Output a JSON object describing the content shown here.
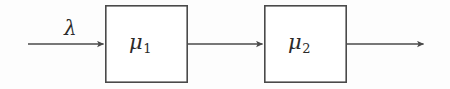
{
  "figure": {
    "type": "block-flow-diagram",
    "canvas": {
      "width": 450,
      "height": 89,
      "background": "#fdfdfd"
    },
    "stroke_color": "#4a4a4a",
    "text_color": "#2b2b2b"
  },
  "labels": {
    "arrival_rate": {
      "symbol": "λ",
      "subscript": ""
    },
    "service_rate_1": {
      "symbol": "μ",
      "subscript": "1"
    },
    "service_rate_2": {
      "symbol": "μ",
      "subscript": "2"
    }
  },
  "nodes": [
    {
      "name": "server-1",
      "label_symbol": "μ",
      "label_subscript": "1",
      "x": 105,
      "y": 5,
      "width": 83,
      "height": 78
    },
    {
      "name": "server-2",
      "label_symbol": "μ",
      "label_subscript": "2",
      "x": 264,
      "y": 5,
      "width": 83,
      "height": 78
    }
  ],
  "arrows": [
    {
      "name": "arrival-arrow",
      "label": "λ",
      "x1": 28,
      "y1": 44,
      "x2": 105,
      "y2": 44
    },
    {
      "name": "interstage-arrow",
      "label": "",
      "x1": 188,
      "y1": 44,
      "x2": 264,
      "y2": 44
    },
    {
      "name": "departure-arrow",
      "label": "",
      "x1": 347,
      "y1": 44,
      "x2": 425,
      "y2": 44
    }
  ]
}
